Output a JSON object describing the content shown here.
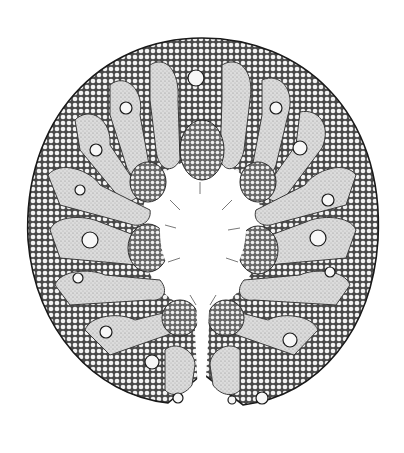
{
  "image": {
    "subject": "botanical cross-section illustration",
    "description": "Stippled ink drawing of a rolled leaf cross-section with a ring of lobed ridges around a central cavity, cellular tissue texture, vascular bundles in each lobe, and a narrow slit at the bottom",
    "colors": {
      "background": "#ffffff",
      "ink": "#1a1a1a",
      "tissue_light": "#e4e4e4",
      "tissue_mid": "#bdbdbd",
      "cell_fill": "#f5f5f5"
    },
    "lobes": 18
  }
}
